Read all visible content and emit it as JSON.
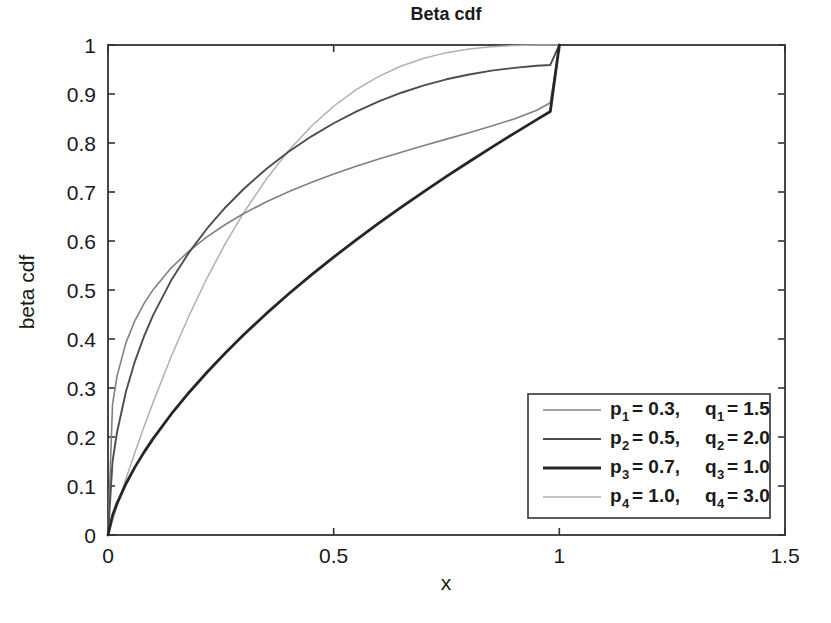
{
  "chart_data": {
    "type": "line",
    "title": "Beta cdf",
    "xlabel": "x",
    "ylabel": "beta cdf",
    "xlim": [
      0,
      1.5
    ],
    "ylim": [
      0,
      1
    ],
    "grid": false,
    "legend_position": "lower-right",
    "xticks": [
      "0",
      "0.5",
      "1",
      "1.5"
    ],
    "xtick_values": [
      0,
      0.5,
      1,
      1.5
    ],
    "yticks": [
      "0",
      "0.1",
      "0.2",
      "0.3",
      "0.4",
      "0.5",
      "0.6",
      "0.7",
      "0.8",
      "0.9",
      "1"
    ],
    "ytick_values": [
      0,
      0.1,
      0.2,
      0.3,
      0.4,
      0.5,
      0.6,
      0.7,
      0.8,
      0.9,
      1
    ],
    "x": [
      0,
      0.01,
      0.02,
      0.04,
      0.06,
      0.08,
      0.1,
      0.14,
      0.18,
      0.22,
      0.26,
      0.3,
      0.35,
      0.4,
      0.45,
      0.5,
      0.55,
      0.6,
      0.65,
      0.7,
      0.75,
      0.8,
      0.85,
      0.9,
      0.95,
      0.98,
      1
    ],
    "series": [
      {
        "name": "p1 = 0.3,  q1 = 1.5",
        "p": 0.3,
        "q": 1.5,
        "color": "#808080",
        "width": 1.6,
        "values": [
          0,
          0.2665,
          0.3242,
          0.3931,
          0.4382,
          0.4726,
          0.5007,
          0.5452,
          0.58,
          0.6089,
          0.6337,
          0.6556,
          0.6795,
          0.7005,
          0.7194,
          0.7366,
          0.7524,
          0.7673,
          0.7813,
          0.7948,
          0.8079,
          0.821,
          0.8345,
          0.8491,
          0.8668,
          0.882,
          1
        ]
      },
      {
        "name": "p2 = 0.5,  q2 = 2.0",
        "p": 0.5,
        "q": 2.0,
        "color": "#4d4d4d",
        "width": 1.9,
        "values": [
          0,
          0.1492,
          0.2097,
          0.2933,
          0.3554,
          0.4059,
          0.4488,
          0.5197,
          0.5773,
          0.6261,
          0.6684,
          0.7057,
          0.7466,
          0.782,
          0.8131,
          0.8403,
          0.8641,
          0.8848,
          0.9026,
          0.9176,
          0.93,
          0.9399,
          0.9476,
          0.9533,
          0.9576,
          0.9593,
          1
        ]
      },
      {
        "name": "p3 = 0.7,  q3 = 1.0",
        "p": 0.7,
        "q": 1.0,
        "color": "#262626",
        "width": 2.8,
        "values": [
          0,
          0.0398,
          0.0646,
          0.1051,
          0.139,
          0.1691,
          0.1967,
          0.2465,
          0.2914,
          0.3327,
          0.3714,
          0.408,
          0.4512,
          0.4918,
          0.5303,
          0.5671,
          0.6024,
          0.6363,
          0.6691,
          0.7009,
          0.7318,
          0.7618,
          0.7911,
          0.8197,
          0.8477,
          0.8642,
          1
        ]
      },
      {
        "name": "p4 = 1.0,  q4 = 3.0",
        "p": 1.0,
        "q": 3.0,
        "color": "#b0b0b0",
        "width": 1.5,
        "values": [
          0,
          0.0297,
          0.0588,
          0.1153,
          0.1694,
          0.2213,
          0.271,
          0.3644,
          0.4486,
          0.5254,
          0.5948,
          0.657,
          0.7254,
          0.784,
          0.8336,
          0.875,
          0.9089,
          0.936,
          0.9571,
          0.973,
          0.9844,
          0.992,
          0.9966,
          0.999,
          0.9999,
          1.0,
          1
        ]
      }
    ]
  },
  "legend": {
    "entries": [
      {
        "var_p": "p",
        "sub_p": "1",
        "eq_p": "= 0.3,",
        "var_q": "q",
        "sub_q": "1",
        "eq_q": "= 1.5"
      },
      {
        "var_p": "p",
        "sub_p": "2",
        "eq_p": "= 0.5,",
        "var_q": "q",
        "sub_q": "2",
        "eq_q": "= 2.0"
      },
      {
        "var_p": "p",
        "sub_p": "3",
        "eq_p": "= 0.7,",
        "var_q": "q",
        "sub_q": "3",
        "eq_q": "= 1.0"
      },
      {
        "var_p": "p",
        "sub_p": "4",
        "eq_p": "= 1.0,",
        "var_q": "q",
        "sub_q": "4",
        "eq_q": "= 3.0"
      }
    ]
  },
  "style": {
    "axis_color": "#333333",
    "background": "#ffffff",
    "text_color": "#1a1a1a"
  }
}
